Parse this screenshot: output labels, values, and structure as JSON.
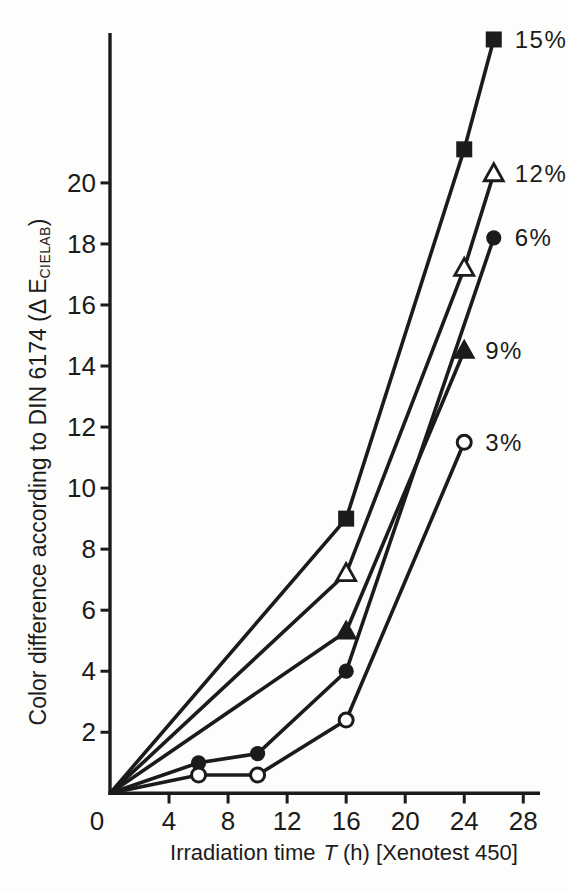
{
  "figure": {
    "background_color": "#fdfdfc",
    "ink_color": "#1b1b1b"
  },
  "chart_data": {
    "type": "line",
    "title": "",
    "xlabel": "Irradiation time T (h) [Xenotest 450]",
    "xlabel_parts": {
      "prefix": "Irradiation time",
      "symbol": "T",
      "suffix": "(h) [Xenotest 450]"
    },
    "ylabel": "Color difference according to DIN 6174 (ΔE CIELAB)",
    "ylabel_parts": {
      "prefix": "Color difference according to DIN 6174 (Δ E",
      "subscript": "CIELAB",
      "suffix": ")"
    },
    "xlim": [
      0,
      29
    ],
    "ylim": [
      0,
      24.9
    ],
    "x_ticks": [
      0,
      4,
      8,
      12,
      16,
      20,
      24,
      28
    ],
    "y_ticks": [
      2,
      4,
      6,
      8,
      10,
      12,
      14,
      16,
      18,
      20
    ],
    "grid": false,
    "legend": "labels-at-line-ends",
    "series": [
      {
        "name": "15%",
        "marker": "filled-square",
        "points": [
          [
            0,
            0
          ],
          [
            16,
            9.0
          ],
          [
            24,
            21.1
          ],
          [
            26,
            24.7
          ]
        ]
      },
      {
        "name": "12%",
        "marker": "open-triangle",
        "points": [
          [
            0,
            0
          ],
          [
            16,
            7.2
          ],
          [
            24,
            17.2
          ],
          [
            26,
            20.3
          ]
        ]
      },
      {
        "name": "6%",
        "marker": "filled-circle",
        "points": [
          [
            0,
            0
          ],
          [
            6,
            1.0
          ],
          [
            10,
            1.3
          ],
          [
            16,
            4.0
          ],
          [
            26,
            18.2
          ]
        ]
      },
      {
        "name": "9%",
        "marker": "filled-triangle",
        "points": [
          [
            0,
            0
          ],
          [
            16,
            5.3
          ],
          [
            24,
            14.5
          ]
        ]
      },
      {
        "name": "3%",
        "marker": "open-circle",
        "points": [
          [
            0,
            0
          ],
          [
            6,
            0.6
          ],
          [
            10,
            0.6
          ],
          [
            16,
            2.4
          ],
          [
            24,
            11.5
          ]
        ]
      }
    ]
  }
}
